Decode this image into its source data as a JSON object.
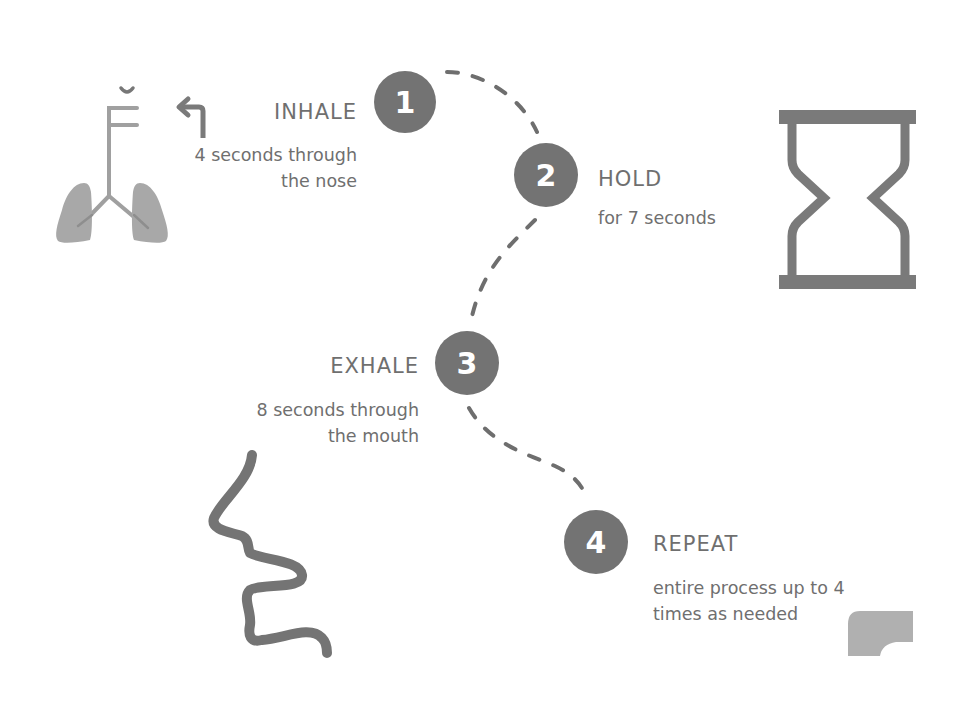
{
  "colors": {
    "background": "#ffffff",
    "circle": "#737373",
    "path": "#6e6e6e",
    "text": "#6f6f6f",
    "icon": "#7a7a7a",
    "icon_light": "#9a9a9a"
  },
  "steps": [
    {
      "number": "1",
      "title": "INHALE",
      "description_lines": [
        "4 seconds through",
        "the nose"
      ],
      "icon": "lungs-icon"
    },
    {
      "number": "2",
      "title": "HOLD",
      "description_lines": [
        "for 7 seconds"
      ],
      "icon": "hourglass-icon"
    },
    {
      "number": "3",
      "title": "EXHALE",
      "description_lines": [
        "8 seconds through",
        "the mouth"
      ],
      "icon": "face-profile-icon"
    },
    {
      "number": "4",
      "title": "REPEAT",
      "description_lines": [
        "entire process up to 4",
        "times as needed"
      ],
      "icon": "rounded-corner-shape-icon"
    }
  ],
  "decorations": {
    "inhale_arrow": "turn-left-arrow-icon",
    "connector": "dashed-curve"
  }
}
